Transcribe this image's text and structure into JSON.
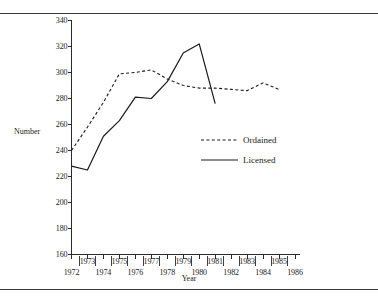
{
  "figure": {
    "xlabel": "Year",
    "ylabel": "Number"
  },
  "legend": {
    "ordained": "Ordained",
    "licensed": "Licensed"
  },
  "chart_data": {
    "type": "line",
    "title": "",
    "xlabel": "Year",
    "ylabel": "Number",
    "xlim": [
      1972,
      1986
    ],
    "ylim": [
      160,
      340
    ],
    "ytick_labels": [
      "160",
      "180",
      "200",
      "220",
      "240",
      "260",
      "280",
      "300",
      "320",
      "340"
    ],
    "yticks": [
      160,
      180,
      200,
      220,
      240,
      260,
      280,
      300,
      320,
      340
    ],
    "xticks": [
      1972,
      1973,
      1974,
      1975,
      1976,
      1977,
      1978,
      1979,
      1980,
      1981,
      1982,
      1983,
      1984,
      1985,
      1986
    ],
    "xtick_labels_upper": [
      "1973",
      "1975",
      "1977",
      "1979",
      "1981",
      "1983",
      "1985"
    ],
    "xtick_labels_lower": [
      "1972",
      "1974",
      "1976",
      "1978",
      "1980",
      "1982",
      "1984",
      "1986"
    ],
    "grid": false,
    "legend_position": "center-right",
    "series": [
      {
        "name": "Ordained",
        "style": "dashed",
        "color": "#1a1a1a",
        "x": [
          1972,
          1973,
          1974,
          1975,
          1976,
          1977,
          1978,
          1979,
          1980,
          1981,
          1982,
          1983,
          1984,
          1985
        ],
        "values": [
          240,
          258,
          277,
          299,
          300,
          302,
          295,
          290,
          288,
          288,
          287,
          286,
          292,
          287
        ]
      },
      {
        "name": "Licensed",
        "style": "solid",
        "color": "#1a1a1a",
        "x": [
          1972,
          1973,
          1974,
          1975,
          1976,
          1977,
          1978,
          1979,
          1980,
          1981
        ],
        "values": [
          228,
          225,
          251,
          263,
          281,
          280,
          293,
          315,
          322,
          276
        ]
      }
    ]
  }
}
